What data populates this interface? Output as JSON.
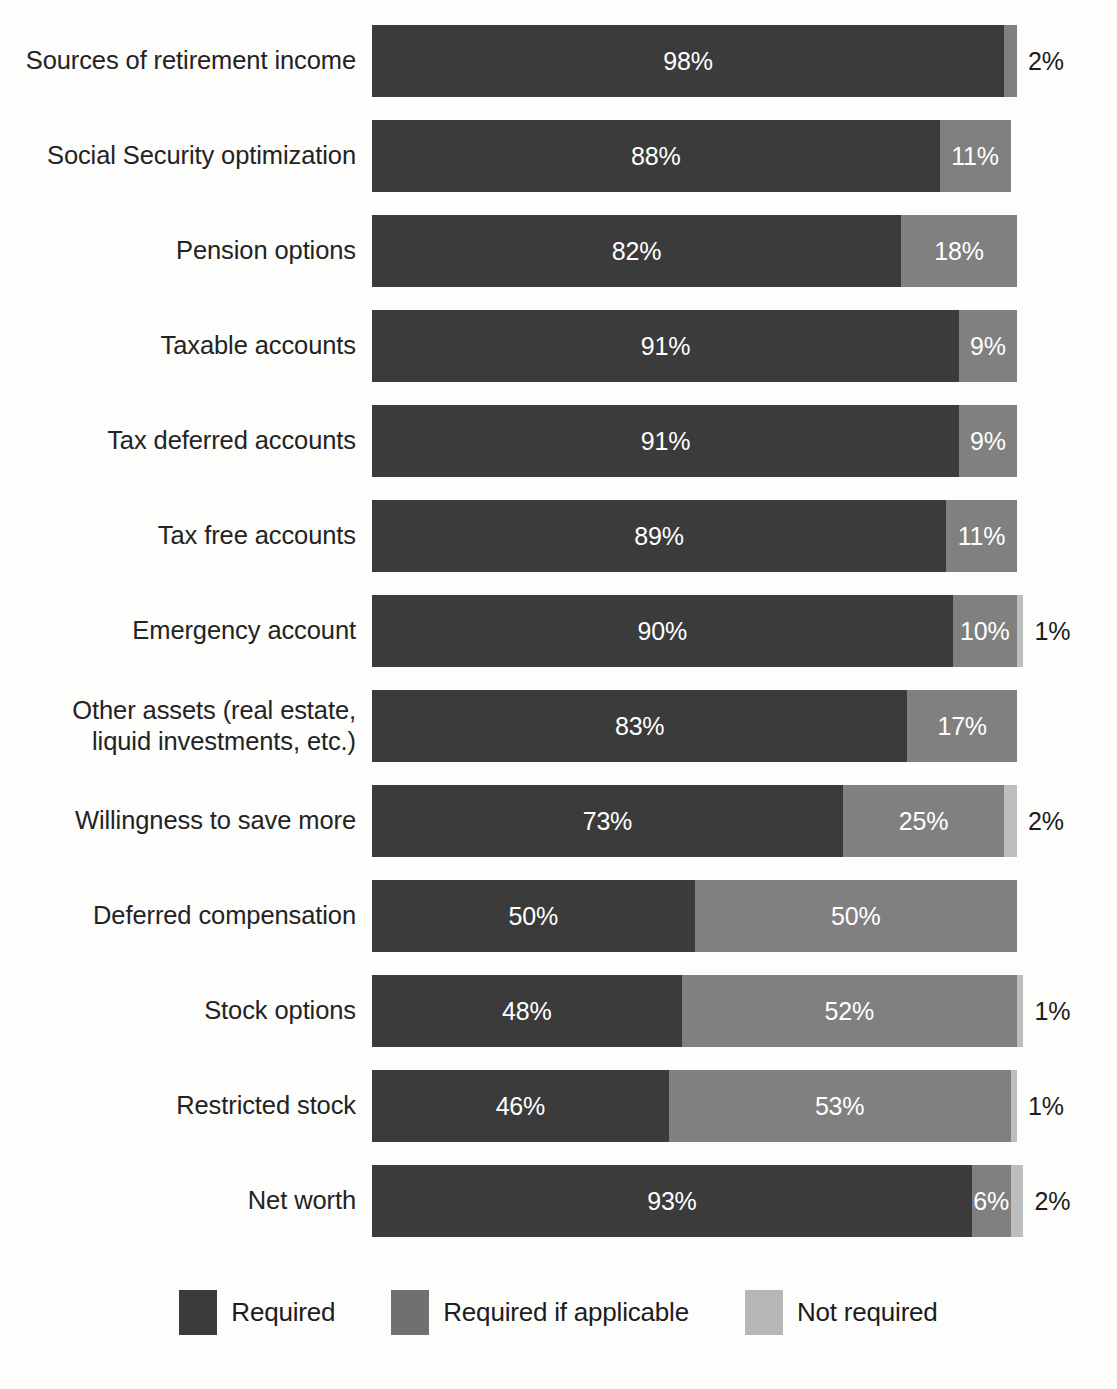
{
  "chart_data": {
    "type": "bar",
    "subtype": "stacked-horizontal-100",
    "title": "",
    "subtitle": "",
    "xlabel": "",
    "ylabel": "",
    "xlim": [
      0,
      100
    ],
    "grid": false,
    "legend_position": "bottom",
    "value_suffix": "%",
    "categories": [
      "Sources of retirement income",
      "Social Security optimization",
      "Pension options",
      "Taxable accounts",
      "Tax deferred accounts",
      "Tax free accounts",
      "Emergency account",
      "Other assets (real estate,\nliquid investments, etc.)",
      "Willingness to save more",
      "Deferred compensation",
      "Stock options",
      "Restricted stock",
      "Net worth"
    ],
    "series": [
      {
        "name": "Required",
        "color": "#3b3b3b",
        "values": [
          98,
          88,
          82,
          91,
          91,
          89,
          90,
          83,
          73,
          50,
          48,
          46,
          93
        ]
      },
      {
        "name": "Required if applicable",
        "color": "#808080",
        "values": [
          2,
          11,
          18,
          9,
          9,
          11,
          10,
          17,
          25,
          50,
          52,
          53,
          6
        ]
      },
      {
        "name": "Not required",
        "color": "#bdbdbd",
        "values": [
          0,
          0,
          0,
          0,
          0,
          0,
          1,
          0,
          2,
          0,
          1,
          1,
          2
        ]
      }
    ],
    "rows": [
      {
        "category": "Sources of retirement income",
        "segments": [
          {
            "series": "Required",
            "value": 98,
            "label": "98%",
            "label_position": "inside"
          },
          {
            "series": "Required if applicable",
            "value": 2,
            "label": "2%",
            "label_position": "outside"
          }
        ]
      },
      {
        "category": "Social Security optimization",
        "segments": [
          {
            "series": "Required",
            "value": 88,
            "label": "88%",
            "label_position": "inside"
          },
          {
            "series": "Required if applicable",
            "value": 11,
            "label": "11%",
            "label_position": "inside"
          }
        ]
      },
      {
        "category": "Pension options",
        "segments": [
          {
            "series": "Required",
            "value": 82,
            "label": "82%",
            "label_position": "inside"
          },
          {
            "series": "Required if applicable",
            "value": 18,
            "label": "18%",
            "label_position": "inside"
          }
        ]
      },
      {
        "category": "Taxable accounts",
        "segments": [
          {
            "series": "Required",
            "value": 91,
            "label": "91%",
            "label_position": "inside"
          },
          {
            "series": "Required if applicable",
            "value": 9,
            "label": "9%",
            "label_position": "inside"
          }
        ]
      },
      {
        "category": "Tax deferred accounts",
        "segments": [
          {
            "series": "Required",
            "value": 91,
            "label": "91%",
            "label_position": "inside"
          },
          {
            "series": "Required if applicable",
            "value": 9,
            "label": "9%",
            "label_position": "inside"
          }
        ]
      },
      {
        "category": "Tax free accounts",
        "segments": [
          {
            "series": "Required",
            "value": 89,
            "label": "89%",
            "label_position": "inside"
          },
          {
            "series": "Required if applicable",
            "value": 11,
            "label": "11%",
            "label_position": "inside"
          }
        ]
      },
      {
        "category": "Emergency account",
        "segments": [
          {
            "series": "Required",
            "value": 90,
            "label": "90%",
            "label_position": "inside"
          },
          {
            "series": "Required if applicable",
            "value": 10,
            "label": "10%",
            "label_position": "inside"
          },
          {
            "series": "Not required",
            "value": 1,
            "label": "1%",
            "label_position": "outside"
          }
        ]
      },
      {
        "category": "Other assets (real estate, liquid investments, etc.)",
        "segments": [
          {
            "series": "Required",
            "value": 83,
            "label": "83%",
            "label_position": "inside"
          },
          {
            "series": "Required if applicable",
            "value": 17,
            "label": "17%",
            "label_position": "inside"
          }
        ]
      },
      {
        "category": "Willingness to save more",
        "segments": [
          {
            "series": "Required",
            "value": 73,
            "label": "73%",
            "label_position": "inside"
          },
          {
            "series": "Required if applicable",
            "value": 25,
            "label": "25%",
            "label_position": "inside"
          },
          {
            "series": "Not required",
            "value": 2,
            "label": "2%",
            "label_position": "outside"
          }
        ]
      },
      {
        "category": "Deferred compensation",
        "segments": [
          {
            "series": "Required",
            "value": 50,
            "label": "50%",
            "label_position": "inside"
          },
          {
            "series": "Required if applicable",
            "value": 50,
            "label": "50%",
            "label_position": "inside"
          }
        ]
      },
      {
        "category": "Stock options",
        "segments": [
          {
            "series": "Required",
            "value": 48,
            "label": "48%",
            "label_position": "inside"
          },
          {
            "series": "Required if applicable",
            "value": 52,
            "label": "52%",
            "label_position": "inside"
          },
          {
            "series": "Not required",
            "value": 1,
            "label": "1%",
            "label_position": "outside"
          }
        ]
      },
      {
        "category": "Restricted stock",
        "segments": [
          {
            "series": "Required",
            "value": 46,
            "label": "46%",
            "label_position": "inside"
          },
          {
            "series": "Required if applicable",
            "value": 53,
            "label": "53%",
            "label_position": "inside"
          },
          {
            "series": "Not required",
            "value": 1,
            "label": "1%",
            "label_position": "outside"
          }
        ]
      },
      {
        "category": "Net worth",
        "segments": [
          {
            "series": "Required",
            "value": 93,
            "label": "93%",
            "label_position": "inside"
          },
          {
            "series": "Required if applicable",
            "value": 6,
            "label": "6%",
            "label_position": "inside"
          },
          {
            "series": "Not required",
            "value": 2,
            "label": "2%",
            "label_position": "outside"
          }
        ]
      }
    ],
    "legend": [
      {
        "label": "Required",
        "color": "#3b3b3b"
      },
      {
        "label": "Required if applicable",
        "color": "#707070"
      },
      {
        "label": "Not required",
        "color": "#b6b6b6"
      }
    ]
  },
  "colors": {
    "required": "#3b3b3b",
    "required_if_applicable": "#808080",
    "not_required": "#bdbdbd",
    "background": "#fdfdfc",
    "text": "#1c1c1c",
    "inside_label_text": "#ffffff"
  }
}
